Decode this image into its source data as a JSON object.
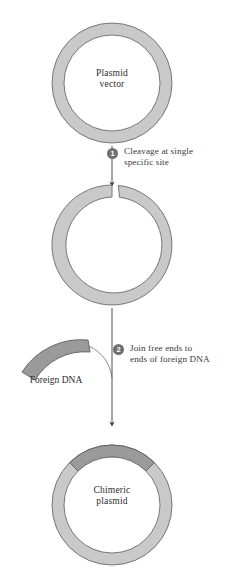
{
  "figure": {
    "background_color": "#ffffff"
  },
  "colors": {
    "ring_fill": "#c9c9c9",
    "ring_stroke": "#6b6b6b",
    "insert_fill": "#9a9a9a",
    "insert_stroke": "#5e5e5e",
    "arrow": "#3a3a3a",
    "badge_fill": "#6f6f6f",
    "badge_text": "#ffffff",
    "text": "#2b2b2b"
  },
  "stages": {
    "plasmid_vector": {
      "label": "Plasmid\nvector",
      "shape": "closed-circular-ring",
      "center_x": 112,
      "center_y": 83,
      "outer_radius": 60,
      "inner_radius": 48
    },
    "cleaved_plasmid": {
      "label": "",
      "shape": "open-circular-ring-with-gap",
      "center_x": 112,
      "center_y": 245,
      "outer_radius": 60,
      "inner_radius": 48,
      "gap_degrees": 7
    },
    "foreign_dna": {
      "label": "Foreign DNA",
      "shape": "dark-arc-segment",
      "fill": "#9a9a9a"
    },
    "chimeric_plasmid": {
      "label": "Chimeric\nplasmid",
      "shape": "closed-circular-ring-with-insert",
      "center_x": 112,
      "center_y": 505,
      "outer_radius": 60,
      "inner_radius": 48,
      "insert_start_degrees": -45,
      "insert_end_degrees": 45
    }
  },
  "steps": [
    {
      "number": "1",
      "text": "Cleavage at single\nspecific site"
    },
    {
      "number": "2",
      "text": "Join free ends to\nends of foreign DNA"
    }
  ]
}
